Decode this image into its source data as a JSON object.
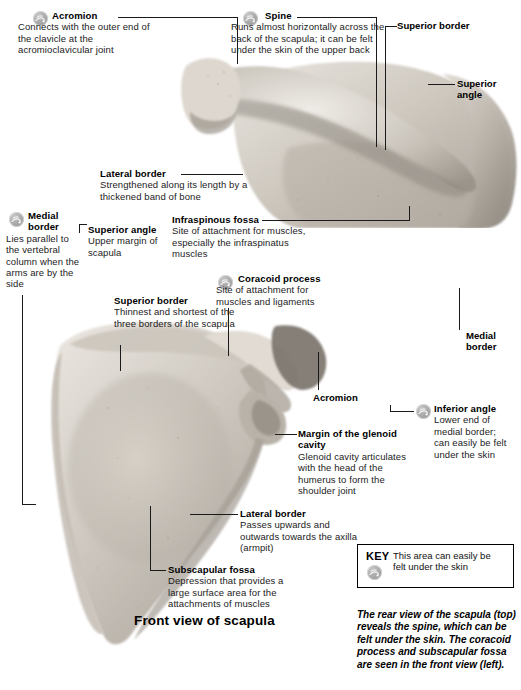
{
  "page": {
    "background": "#ffffff",
    "width": 521,
    "height": 690
  },
  "figure": {
    "front_view_title": "Front view of scapula"
  },
  "annotations": {
    "acromion_top": {
      "title": "Acromion",
      "body": "Connects with the outer end of the clavicle at the acromioclavicular joint",
      "has_badge": true
    },
    "spine": {
      "title": "Spine",
      "body": "Runs almost horizontally across the back of the scapula; it can be felt under the skin of the upper back",
      "has_badge": true
    },
    "superior_border_top": {
      "title": "Superior border",
      "body": "",
      "has_badge": false
    },
    "superior_angle_top": {
      "title": "Superior angle",
      "body": "",
      "has_badge": false
    },
    "lateral_border_top": {
      "title": "Lateral border",
      "body": "Strengthened along its length by a thickened band of bone",
      "has_badge": false
    },
    "medial_border_left": {
      "title": "Medial border",
      "body": "Lies parallel to the vertebral column when the arms are by the side",
      "has_badge": true
    },
    "superior_angle_mid": {
      "title": "Superior angle",
      "body": "Upper margin of scapula",
      "has_badge": false
    },
    "infraspinous_fossa": {
      "title": "Infraspinous fossa",
      "body": "Site of attachment for muscles, especially the infraspinatus muscles",
      "has_badge": false
    },
    "coracoid_process": {
      "title": "Coracoid process",
      "body": "Site of attachment for muscles and ligaments",
      "has_badge": true
    },
    "superior_border_mid": {
      "title": "Superior border",
      "body": "Thinnest and shortest of the three borders of the scapula",
      "has_badge": false
    },
    "medial_border_right": {
      "title": "Medial border",
      "body": "",
      "has_badge": false
    },
    "acromion_lower": {
      "title": "Acromion",
      "body": "",
      "has_badge": false
    },
    "inferior_angle": {
      "title": "Inferior angle",
      "body": "Lower end of medial border; can easily be felt under the skin",
      "has_badge": true
    },
    "glenoid_margin": {
      "title": "Margin of the glenoid cavity",
      "body": "Glenoid cavity articulates with the head of the humerus to form the shoulder joint",
      "has_badge": false
    },
    "lateral_border_lower": {
      "title": "Lateral border",
      "body": "Passes upwards and outwards towards the axilla (armpit)",
      "has_badge": false
    },
    "subscapular_fossa": {
      "title": "Subscapular fossa",
      "body": "Depression that provides a large surface area for the attachments of muscles",
      "has_badge": false
    }
  },
  "key": {
    "label": "KEY",
    "text": "This area can easily be felt under the skin"
  },
  "caption": {
    "text": "The rear view of the scapula (top) reveals the spine, which can be felt under the skin. The coracoid process and subscapular fossa are seen in the front view (left)."
  },
  "colors": {
    "text": "#111111",
    "line": "#1a1a1a",
    "badge": "#a6a6a6",
    "bone_light": "#e6e2dd",
    "bone_mid": "#c9c3bb",
    "bone_dark": "#8d8madd"
  },
  "icons": {
    "badge": "hand-touch-skin-icon"
  }
}
